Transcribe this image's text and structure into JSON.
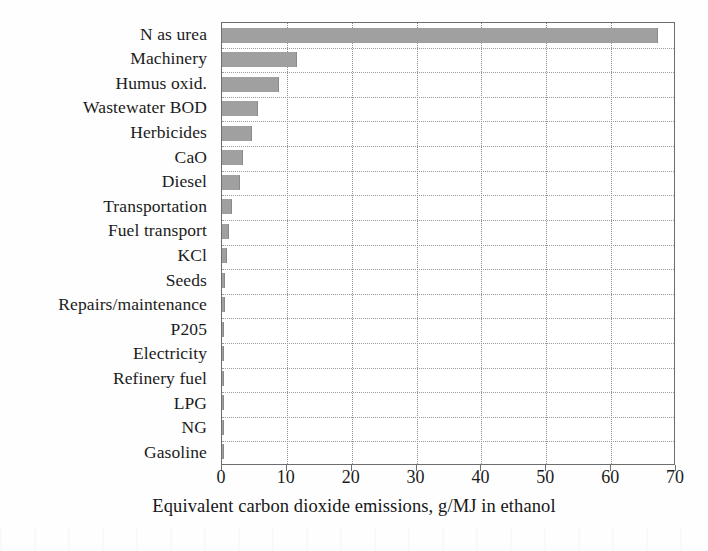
{
  "chart_data": {
    "type": "bar",
    "orientation": "horizontal",
    "title": "",
    "xlabel": "Equivalent carbon dioxide emissions, g/MJ in ethanol",
    "ylabel": "",
    "xlim": [
      0,
      70
    ],
    "xticks": [
      0,
      10,
      20,
      30,
      40,
      50,
      60,
      70
    ],
    "xtick_labels": [
      "0",
      "10",
      "20",
      "30",
      "40",
      "50",
      "60",
      "70"
    ],
    "grid": true,
    "grid_style": "dotted",
    "legend": "none",
    "bar_color": "#a0a0a0",
    "axis_color": "#6e6e6e",
    "categories": [
      "N as urea",
      "Machinery",
      "Humus oxid.",
      "Wastewater BOD",
      "Herbicides",
      "CaO",
      "Diesel",
      "Transportation",
      "Fuel transport",
      "KCl",
      "Seeds",
      "Repairs/maintenance",
      "P205",
      "Electricity",
      "Refinery fuel",
      "LPG",
      "NG",
      "Gasoline"
    ],
    "values": [
      67.0,
      11.4,
      8.6,
      5.4,
      4.5,
      3.1,
      2.6,
      1.4,
      1.0,
      0.55,
      0.35,
      0.3,
      0.12,
      0.1,
      0.08,
      0.06,
      0.05,
      0.04
    ]
  },
  "axis": {
    "x_title": "Equivalent carbon dioxide emissions, g/MJ in ethanol"
  }
}
